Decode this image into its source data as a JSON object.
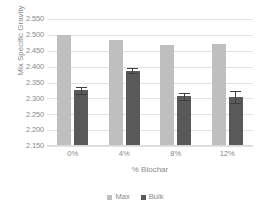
{
  "chart_data": {
    "type": "bar",
    "title": "",
    "xlabel": "% Biochar",
    "ylabel": "Mix Specific Gravity",
    "categories": [
      "0%",
      "4%",
      "8%",
      "12%"
    ],
    "ylim": [
      2.15,
      2.55
    ],
    "ytick_step": 0.05,
    "ytick_labels": [
      "2.550",
      "2.500",
      "2.450",
      "2.400",
      "2.350",
      "2.300",
      "2.250",
      "2.200",
      "2.150"
    ],
    "grid": "horizontal",
    "legend_position": "bottom-center",
    "series": [
      {
        "name": "Max",
        "color": "#bfbfbf",
        "values": [
          2.499,
          2.485,
          2.467,
          2.47
        ],
        "errors": [
          0,
          0,
          0,
          0
        ]
      },
      {
        "name": "Bulk",
        "color": "#595959",
        "values": [
          2.325,
          2.387,
          2.307,
          2.304
        ],
        "errors": [
          0.012,
          0.008,
          0.011,
          0.018
        ]
      }
    ]
  },
  "axes": {
    "y_title": "Mix Specific Gravity",
    "x_title": "% Biochar"
  },
  "legend": {
    "items": [
      {
        "label": "Max",
        "color": "#bfbfbf"
      },
      {
        "label": "Bulk",
        "color": "#595959"
      }
    ]
  },
  "colors": {
    "max_series": "#bfbfbf",
    "bulk_series": "#595959",
    "gridline": "#e2e2e2",
    "text": "#8a8a8a",
    "error_bar": "#404040",
    "background": "#ffffff"
  }
}
